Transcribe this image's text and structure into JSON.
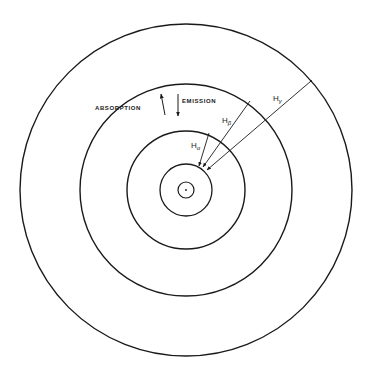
{
  "diagram": {
    "type": "bohr-atom-energy-levels",
    "center": {
      "x": 186,
      "y": 190
    },
    "orbits": [
      {
        "id": "n1",
        "radius": 8
      },
      {
        "id": "n2",
        "radius": 26
      },
      {
        "id": "n3",
        "radius": 59
      },
      {
        "id": "n4",
        "radius": 106
      },
      {
        "id": "n5",
        "radius": 166
      }
    ],
    "colors": {
      "stroke": "#1a1a1a",
      "background": "#ffffff"
    },
    "labels": {
      "absorption": "ABSORPTION",
      "emission": "EMISSION"
    },
    "transitions": [
      {
        "id": "h-alpha",
        "symbol": "H",
        "subscript": "α",
        "from_orbit": "n3",
        "to_orbit": "n2"
      },
      {
        "id": "h-beta",
        "symbol": "H",
        "subscript": "β",
        "from_orbit": "n4",
        "to_orbit": "n2"
      },
      {
        "id": "h-gamma",
        "symbol": "H",
        "subscript": "γ",
        "from_orbit": "n5",
        "to_orbit": "n2"
      }
    ]
  }
}
